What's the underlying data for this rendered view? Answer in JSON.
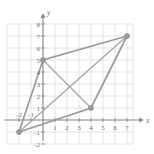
{
  "figure": {
    "kind": "coordinate-plane-scatter-polygon",
    "axis_labels": {
      "x": "x",
      "y": "y"
    }
  },
  "chart_data": {
    "type": "scatter",
    "title": "",
    "xlabel": "x",
    "ylabel": "y",
    "xlim": [
      -3,
      7.5
    ],
    "ylim": [
      -2,
      8
    ],
    "grid": true,
    "legend": "none",
    "x_ticks": [
      -2,
      -1,
      1,
      2,
      3,
      4,
      5,
      6,
      7
    ],
    "y_ticks": [
      -2,
      -1,
      1,
      2,
      3,
      4,
      5,
      6,
      7,
      8
    ],
    "x_tick_labels": [
      "-2",
      "-1",
      "1",
      "2",
      "3",
      "4",
      "5",
      "6",
      "7"
    ],
    "y_tick_labels": [
      "-2",
      "-1",
      "1",
      "2",
      "3",
      "4",
      "5",
      "6",
      "7",
      "8"
    ],
    "points": [
      {
        "name": "vertex-a",
        "x": -2,
        "y": -1
      },
      {
        "name": "vertex-b",
        "x": 0,
        "y": 5
      },
      {
        "name": "vertex-c",
        "x": 7,
        "y": 7
      },
      {
        "name": "vertex-d",
        "x": 4,
        "y": 1
      }
    ],
    "series": [
      {
        "name": "parallelogram-outline",
        "kind": "edge",
        "path": [
          [
            -2,
            -1
          ],
          [
            0,
            5
          ],
          [
            7,
            7
          ],
          [
            4,
            1
          ],
          [
            -2,
            -1
          ]
        ]
      },
      {
        "name": "diagonal-a-c",
        "kind": "diagonal",
        "path": [
          [
            -2,
            -1
          ],
          [
            7,
            7
          ]
        ]
      },
      {
        "name": "diagonal-b-d",
        "kind": "diagonal",
        "path": [
          [
            0,
            5
          ],
          [
            4,
            1
          ]
        ]
      }
    ]
  }
}
